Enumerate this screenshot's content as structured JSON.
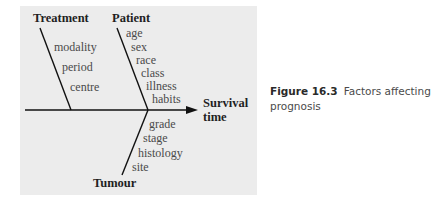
{
  "diagram": {
    "type": "fishbone",
    "effect": {
      "line1": "Survival",
      "line2": "time"
    },
    "categories": [
      {
        "name": "Treatment",
        "causes": [
          "modality",
          "period",
          "centre"
        ]
      },
      {
        "name": "Patient",
        "causes": [
          "age",
          "sex",
          "race",
          "class",
          "illness",
          "habits"
        ]
      },
      {
        "name": "Tumour",
        "causes": [
          "grade",
          "stage",
          "histology",
          "site"
        ]
      }
    ]
  },
  "caption": {
    "number": "Figure 16.3",
    "text": "Factors affecting prognosis"
  },
  "colors": {
    "panel_bg": "#ececec",
    "line": "#111111",
    "label": "#4a4a4a",
    "heading": "#1f1f1f"
  }
}
